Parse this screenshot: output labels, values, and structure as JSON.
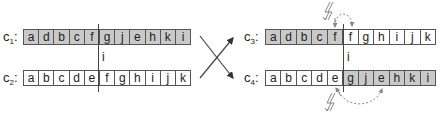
{
  "colors": {
    "shaded_cell": "#c9c9c9",
    "plain_cell": "#ffffff",
    "border": "#555555",
    "arrow": "#444444",
    "swap_arrow": "#888888"
  },
  "left": {
    "cut_label": "i",
    "rows": [
      {
        "label": "c",
        "subscript": "1",
        "cells": [
          {
            "v": "a",
            "s": true
          },
          {
            "v": "d",
            "s": true
          },
          {
            "v": "b",
            "s": true
          },
          {
            "v": "c",
            "s": true
          },
          {
            "v": "f",
            "s": true
          },
          {
            "v": "g",
            "s": true
          },
          {
            "v": "j",
            "s": true
          },
          {
            "v": "e",
            "s": true
          },
          {
            "v": "h",
            "s": true
          },
          {
            "v": "k",
            "s": true
          },
          {
            "v": "i",
            "s": true
          }
        ]
      },
      {
        "label": "c",
        "subscript": "2",
        "cells": [
          {
            "v": "a",
            "s": false
          },
          {
            "v": "b",
            "s": false
          },
          {
            "v": "c",
            "s": false
          },
          {
            "v": "d",
            "s": false
          },
          {
            "v": "e",
            "s": false
          },
          {
            "v": "f",
            "s": false
          },
          {
            "v": "g",
            "s": false
          },
          {
            "v": "h",
            "s": false
          },
          {
            "v": "i",
            "s": false
          },
          {
            "v": "j",
            "s": false
          },
          {
            "v": "k",
            "s": false
          }
        ]
      }
    ]
  },
  "right": {
    "cut_label": "i",
    "rows": [
      {
        "label": "c",
        "subscript": "3",
        "cells": [
          {
            "v": "a",
            "s": true
          },
          {
            "v": "d",
            "s": true
          },
          {
            "v": "b",
            "s": true
          },
          {
            "v": "c",
            "s": true
          },
          {
            "v": "f",
            "s": true
          },
          {
            "v": "f",
            "s": false
          },
          {
            "v": "g",
            "s": false
          },
          {
            "v": "h",
            "s": false
          },
          {
            "v": "i",
            "s": false
          },
          {
            "v": "j",
            "s": false
          },
          {
            "v": "k",
            "s": false
          }
        ]
      },
      {
        "label": "c",
        "subscript": "4",
        "cells": [
          {
            "v": "a",
            "s": false
          },
          {
            "v": "b",
            "s": false
          },
          {
            "v": "c",
            "s": false
          },
          {
            "v": "d",
            "s": false
          },
          {
            "v": "e",
            "s": false
          },
          {
            "v": "g",
            "s": true
          },
          {
            "v": "j",
            "s": true
          },
          {
            "v": "e",
            "s": true
          },
          {
            "v": "h",
            "s": true
          },
          {
            "v": "k",
            "s": true
          },
          {
            "v": "i",
            "s": true
          }
        ]
      }
    ]
  },
  "annotations": {
    "crossover_symbol": "X",
    "conflict_icons": [
      "lightning-icon-top",
      "lightning-icon-bottom"
    ],
    "conflict_pairs": [
      {
        "row": "c3",
        "from_index": 4,
        "to_index": 5,
        "value": "f"
      },
      {
        "row": "c4",
        "from_index": 4,
        "to_index": 7,
        "value": "e"
      }
    ]
  }
}
